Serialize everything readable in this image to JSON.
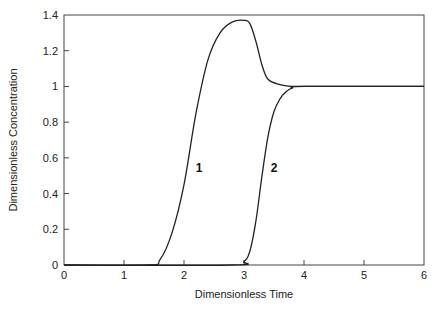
{
  "chart_data": {
    "type": "line",
    "title": "",
    "xlabel": "Dimensionless Time",
    "ylabel": "Dimensionless Concentration",
    "xlim": [
      0,
      6
    ],
    "ylim": [
      0,
      1.4
    ],
    "xticks": [
      0,
      1,
      2,
      3,
      4,
      5,
      6
    ],
    "yticks": [
      0,
      0.2,
      0.4,
      0.6,
      0.8,
      1,
      1.2,
      1.4
    ],
    "xtick_labels": [
      "0",
      "1",
      "2",
      "3",
      "4",
      "5",
      "6"
    ],
    "ytick_labels": [
      "0",
      "0.2",
      "0.4",
      "0.6",
      "0.8",
      "1",
      "1.2",
      "1.4"
    ],
    "grid": false,
    "legend": "none (inline curve labels)",
    "series": [
      {
        "name": "1",
        "x": [
          0,
          1.4,
          1.6,
          1.8,
          2.0,
          2.2,
          2.4,
          2.6,
          2.8,
          3.0,
          3.1,
          3.2,
          3.3,
          3.4,
          3.6,
          3.8,
          4.0,
          6.0
        ],
        "y": [
          0,
          0,
          0.03,
          0.18,
          0.45,
          0.85,
          1.15,
          1.3,
          1.36,
          1.37,
          1.35,
          1.25,
          1.12,
          1.04,
          1.01,
          1.0,
          1.0,
          1.0
        ],
        "label_position": {
          "x": 2.25,
          "y": 0.52
        }
      },
      {
        "name": "2",
        "x": [
          0,
          2.8,
          3.0,
          3.1,
          3.2,
          3.3,
          3.4,
          3.5,
          3.6,
          3.7,
          3.8,
          4.0,
          6.0
        ],
        "y": [
          0,
          0,
          0.02,
          0.08,
          0.25,
          0.5,
          0.72,
          0.86,
          0.93,
          0.97,
          0.99,
          1.0,
          1.0
        ],
        "label_position": {
          "x": 3.5,
          "y": 0.52
        }
      }
    ]
  },
  "labels": {
    "xlabel": "Dimensionless Time",
    "ylabel": "Dimensionless Concentration",
    "curve1": "1",
    "curve2": "2"
  }
}
